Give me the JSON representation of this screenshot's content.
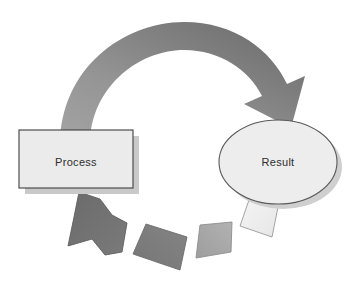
{
  "diagram": {
    "type": "cycle-process-diagram",
    "title": "",
    "background_color": "#ffffff",
    "nodes": [
      {
        "id": "process",
        "label": "Process",
        "shape": "rectangle",
        "fill_color": "#ebebeb",
        "border_color": "#3f3f3f",
        "text_color": "#2e2e2e",
        "shadow_color": "#c9c9c9",
        "x": 19,
        "y": 130,
        "width": 114,
        "height": 58
      },
      {
        "id": "result",
        "label": "Result",
        "shape": "ellipse",
        "fill_color": "#ededed",
        "border_color": "#5a5a5a",
        "text_color": "#2e2e2e",
        "shadow_color": "#cfcfcf",
        "cx": 278,
        "cy": 162,
        "rx": 59,
        "ry": 42
      }
    ],
    "connectors": [
      {
        "id": "forward-arrow",
        "from": "process",
        "to": "result",
        "direction": "clockwise",
        "style": "solid-arc-arrow",
        "gradient_start_color": "#9b9b9b",
        "gradient_end_color": "#6e6e6e",
        "arrowhead": "down-left"
      },
      {
        "id": "return-segment-1",
        "from": "result",
        "to": "process",
        "direction": "counter-clockwise",
        "style": "arc-segment",
        "fill_color": "#f2f2f2",
        "border_color": "#8a8a8a",
        "order": 1
      },
      {
        "id": "return-segment-2",
        "from": "result",
        "to": "process",
        "direction": "counter-clockwise",
        "style": "arc-segment",
        "fill_color": "#a6a6a6",
        "border_color": "#8a8a8a",
        "order": 2
      },
      {
        "id": "return-segment-3",
        "from": "result",
        "to": "process",
        "direction": "counter-clockwise",
        "style": "arc-segment",
        "fill_color": "#7d7d7d",
        "border_color": "#6a6a6a",
        "order": 3
      },
      {
        "id": "return-arrow",
        "from": "result",
        "to": "process",
        "direction": "counter-clockwise",
        "style": "arc-segment-arrow",
        "fill_color": "#707070",
        "border_color": "#5e5e5e",
        "arrowhead": "up-left",
        "order": 4
      }
    ]
  }
}
